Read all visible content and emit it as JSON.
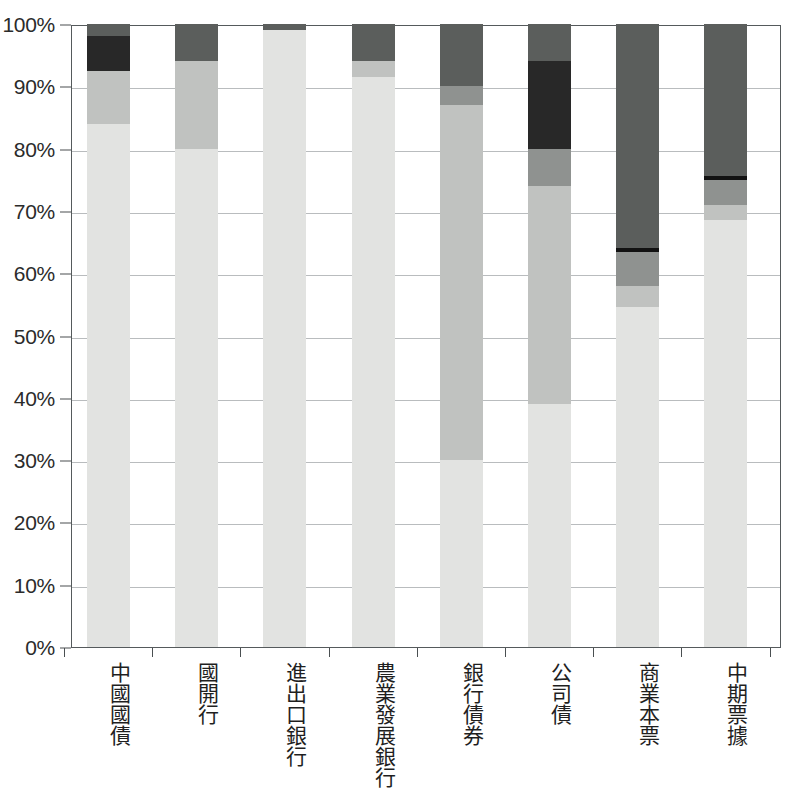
{
  "chart_data": {
    "type": "bar",
    "subtype": "stacked-percentage-bar",
    "title": "",
    "subtitle": "",
    "xlabel": "",
    "ylabel": "",
    "ylim": [
      0,
      100
    ],
    "y_unit": "%",
    "grid": true,
    "legend": "none",
    "y_ticks": [
      "0%",
      "10%",
      "20%",
      "30%",
      "40%",
      "50%",
      "60%",
      "70%",
      "80%",
      "90%",
      "100%"
    ],
    "y_tick_values": [
      0,
      10,
      20,
      30,
      40,
      50,
      60,
      70,
      80,
      90,
      100
    ],
    "categories": [
      "中國國債",
      "國開行",
      "進出口銀行",
      "農業發展銀行",
      "銀行債券",
      "公司債",
      "商業本票",
      "中期票據"
    ],
    "series": [
      {
        "name": "series-1",
        "color": "#e2e3e1",
        "values": [
          84.0,
          80.0,
          99.0,
          91.5,
          30.0,
          39.0,
          54.5,
          68.5
        ]
      },
      {
        "name": "series-2",
        "color": "#c0c2c0",
        "values": [
          8.5,
          14.0,
          0.0,
          2.5,
          57.0,
          35.0,
          3.5,
          2.5
        ]
      },
      {
        "name": "series-3",
        "color": "#8f9290",
        "values": [
          0.0,
          0.0,
          0.0,
          0.0,
          3.0,
          6.0,
          4.0,
          4.0
        ]
      },
      {
        "name": "series-4",
        "color": "#282828",
        "values": [
          5.5,
          0.0,
          0.0,
          0.0,
          0.0,
          14.0,
          0.6,
          0.6
        ]
      },
      {
        "name": "series-5",
        "color": "#5b5e5c",
        "values": [
          2.0,
          6.0,
          1.0,
          6.0,
          10.0,
          6.0,
          37.4,
          24.4
        ]
      }
    ],
    "stack_order_bottom_to_top": [
      "series-1",
      "series-2",
      "series-3",
      "series-4",
      "series-5"
    ],
    "bars": [
      {
        "category": "中國國債",
        "segments": [
          {
            "from": 0.0,
            "to": 84.0,
            "color": "#e2e3e1"
          },
          {
            "from": 84.0,
            "to": 92.5,
            "color": "#c0c2c0"
          },
          {
            "from": 92.5,
            "to": 98.0,
            "color": "#282828"
          },
          {
            "from": 98.0,
            "to": 100.0,
            "color": "#5b5e5c"
          }
        ]
      },
      {
        "category": "國開行",
        "segments": [
          {
            "from": 0.0,
            "to": 80.0,
            "color": "#e2e3e1"
          },
          {
            "from": 80.0,
            "to": 94.0,
            "color": "#c0c2c0"
          },
          {
            "from": 94.0,
            "to": 100.0,
            "color": "#5b5e5c"
          }
        ]
      },
      {
        "category": "進出口銀行",
        "segments": [
          {
            "from": 0.0,
            "to": 99.0,
            "color": "#e2e3e1"
          },
          {
            "from": 99.0,
            "to": 100.0,
            "color": "#5b5e5c"
          }
        ]
      },
      {
        "category": "農業發展銀行",
        "segments": [
          {
            "from": 0.0,
            "to": 91.5,
            "color": "#e2e3e1"
          },
          {
            "from": 91.5,
            "to": 94.0,
            "color": "#c0c2c0"
          },
          {
            "from": 94.0,
            "to": 100.0,
            "color": "#5b5e5c"
          }
        ]
      },
      {
        "category": "銀行債券",
        "segments": [
          {
            "from": 0.0,
            "to": 30.0,
            "color": "#e2e3e1"
          },
          {
            "from": 30.0,
            "to": 87.0,
            "color": "#c0c2c0"
          },
          {
            "from": 87.0,
            "to": 90.0,
            "color": "#8f9290"
          },
          {
            "from": 90.0,
            "to": 100.0,
            "color": "#5b5e5c"
          }
        ]
      },
      {
        "category": "公司債",
        "segments": [
          {
            "from": 0.0,
            "to": 39.0,
            "color": "#e2e3e1"
          },
          {
            "from": 39.0,
            "to": 74.0,
            "color": "#c0c2c0"
          },
          {
            "from": 74.0,
            "to": 80.0,
            "color": "#8f9290"
          },
          {
            "from": 80.0,
            "to": 94.0,
            "color": "#282828"
          },
          {
            "from": 94.0,
            "to": 100.0,
            "color": "#5b5e5c"
          }
        ]
      },
      {
        "category": "商業本票",
        "segments": [
          {
            "from": 0.0,
            "to": 54.5,
            "color": "#e2e3e1"
          },
          {
            "from": 54.5,
            "to": 58.0,
            "color": "#c0c2c0"
          },
          {
            "from": 58.0,
            "to": 63.4,
            "color": "#8f9290"
          },
          {
            "from": 63.4,
            "to": 64.0,
            "color": "#121212"
          },
          {
            "from": 64.0,
            "to": 100.0,
            "color": "#5b5e5c"
          }
        ]
      },
      {
        "category": "中期票據",
        "segments": [
          {
            "from": 0.0,
            "to": 68.5,
            "color": "#e2e3e1"
          },
          {
            "from": 68.5,
            "to": 71.0,
            "color": "#c0c2c0"
          },
          {
            "from": 71.0,
            "to": 75.0,
            "color": "#8f9290"
          },
          {
            "from": 75.0,
            "to": 75.6,
            "color": "#121212"
          },
          {
            "from": 75.6,
            "to": 100.0,
            "color": "#5b5e5c"
          }
        ]
      }
    ]
  },
  "axis": {
    "frame_color": "#555a5c",
    "grid_color": "#b9bcbe",
    "tick_color": "#4a4f51",
    "label_color": "#2b2b2b"
  }
}
